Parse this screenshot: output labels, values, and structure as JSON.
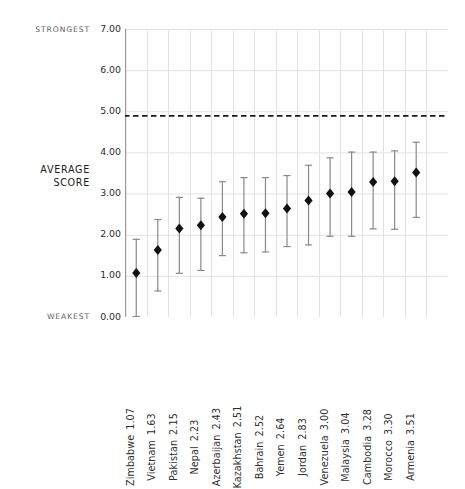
{
  "annotations": {
    "strongest": "STRONGEST",
    "weakest": "WEAKEST",
    "axis_title_line1": "AVERAGE",
    "axis_title_line2": "SCORE"
  },
  "colors": {
    "marker": "#111111",
    "errorbar": "#8a8a8a",
    "grid": "#e2e2e2",
    "axis": "#9a9a9a",
    "threshold": "#1a1a1a",
    "label_text": "#2f2f2f",
    "anno_text": "#5f5f5f"
  },
  "chart_data": {
    "type": "scatter",
    "title": "",
    "xlabel": "",
    "ylabel": "AVERAGE SCORE",
    "ylim": [
      0,
      7
    ],
    "yticks": [
      "0.00",
      "1.00",
      "2.00",
      "3.00",
      "4.00",
      "5.00",
      "6.00",
      "7.00"
    ],
    "ytick_values": [
      0,
      1,
      2,
      3,
      4,
      5,
      6,
      7
    ],
    "grid": true,
    "legend": "none",
    "threshold_line": {
      "value": 4.9,
      "style": "dashed",
      "label": ""
    },
    "axis_annotations": {
      "top": "STRONGEST",
      "bottom": "WEAKEST"
    },
    "categories": [
      "Zimbabwe",
      "Vietnam",
      "Pakistan",
      "Nepal",
      "Azerbaijan",
      "Kazakhstan",
      "Bahrain",
      "Yemen",
      "Jordan",
      "Venezuela",
      "Malaysia",
      "Cambodia",
      "Morocco",
      "Armenia"
    ],
    "values": [
      1.07,
      1.63,
      2.15,
      2.23,
      2.43,
      2.51,
      2.52,
      2.64,
      2.83,
      3.0,
      3.04,
      3.28,
      3.3,
      3.51
    ],
    "value_labels": [
      "1.07",
      "1.63",
      "2.15",
      "2.23",
      "2.43",
      "2.51",
      "2.52",
      "2.64",
      "2.83",
      "3.00",
      "3.04",
      "3.28",
      "3.30",
      "3.51"
    ],
    "tick_labels": [
      "Zimbabwe 1.07",
      "Vietnam 1.63",
      "Pakistan 2.15",
      "Nepal 2.23",
      "Azerbaijan 2.43",
      "Kazakhstan 2.51",
      "Bahrain 2.52",
      "Yemen 2.64",
      "Jordan 2.83",
      "Venezuela 3.00",
      "Malaysia 3.04",
      "Cambodia 3.28",
      "Morocco 3.30",
      "Armenia 3.51"
    ],
    "error_low": [
      0.0,
      0.62,
      1.05,
      1.12,
      1.48,
      1.55,
      1.57,
      1.7,
      1.74,
      1.95,
      1.95,
      2.13,
      2.12,
      2.41
    ],
    "error_high": [
      1.9,
      2.38,
      2.92,
      2.9,
      3.3,
      3.4,
      3.4,
      3.45,
      3.7,
      3.88,
      4.02,
      4.02,
      4.05,
      4.26
    ],
    "points": [
      {
        "category": "Zimbabwe",
        "value": 1.07,
        "low": 0.0,
        "high": 1.9
      },
      {
        "category": "Vietnam",
        "value": 1.63,
        "low": 0.62,
        "high": 2.38
      },
      {
        "category": "Pakistan",
        "value": 2.15,
        "low": 1.05,
        "high": 2.92
      },
      {
        "category": "Nepal",
        "value": 2.23,
        "low": 1.12,
        "high": 2.9
      },
      {
        "category": "Azerbaijan",
        "value": 2.43,
        "low": 1.48,
        "high": 3.3
      },
      {
        "category": "Kazakhstan",
        "value": 2.51,
        "low": 1.55,
        "high": 3.4
      },
      {
        "category": "Bahrain",
        "value": 2.52,
        "low": 1.57,
        "high": 3.4
      },
      {
        "category": "Yemen",
        "value": 2.64,
        "low": 1.7,
        "high": 3.45
      },
      {
        "category": "Jordan",
        "value": 2.83,
        "low": 1.74,
        "high": 3.7
      },
      {
        "category": "Venezuela",
        "value": 3.0,
        "low": 1.95,
        "high": 3.88
      },
      {
        "category": "Malaysia",
        "value": 3.04,
        "low": 1.95,
        "high": 4.02
      },
      {
        "category": "Cambodia",
        "value": 3.28,
        "low": 2.13,
        "high": 4.02
      },
      {
        "category": "Morocco",
        "value": 3.3,
        "low": 2.12,
        "high": 4.05
      },
      {
        "category": "Armenia",
        "value": 3.51,
        "low": 2.41,
        "high": 4.26
      }
    ]
  }
}
